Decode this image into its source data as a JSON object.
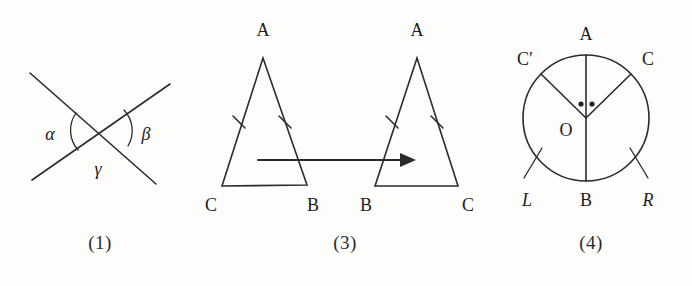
{
  "sheet": {
    "width": 692,
    "height": 286,
    "background": "#fdfdfb",
    "ink": "#2d2a28"
  },
  "figures": [
    {
      "id": "crossed-lines",
      "caption": "(1)",
      "description": "two straight lines crossing at a point, with angles alpha, beta and gamma marked by arcs",
      "labels": {
        "alpha": "α",
        "beta": "β",
        "gamma": "γ"
      }
    },
    {
      "id": "congruent-triangles",
      "caption": "(3)",
      "description": "two congruent isosceles triangles, the right one being the mirror image of the left, joined by a horizontal arrow",
      "left_triangle": {
        "apex": "A",
        "bottom_left": "C",
        "bottom_right": "B"
      },
      "right_triangle": {
        "apex": "A",
        "bottom_left": "B",
        "bottom_right": "C"
      },
      "arrow": "transformation-arrow",
      "tick_marks": "single tick on each of the two equal legs"
    },
    {
      "id": "circle-diagram",
      "caption": "(4)",
      "description": "circle with centre O, vertical diameter AB, two radii to C and C-prime, equal central angles marked by dots, arcs labelled L and R",
      "labels": {
        "top": "A",
        "bottom": "B",
        "centre": "O",
        "right_point": "C",
        "left_point": "C′",
        "left_arc": "L",
        "right_arc": "R"
      }
    }
  ]
}
